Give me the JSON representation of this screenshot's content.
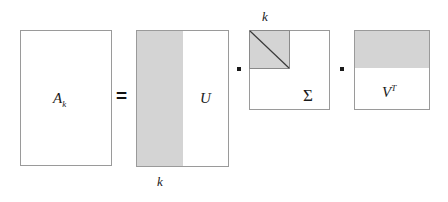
{
  "figure": {
    "equals_symbol": "=",
    "multiply_symbol": "·",
    "shade_color": "#d4d4d4",
    "border_color": "#9a9a9a",
    "text_color": "#1a1a1a",
    "background_color": "#ffffff"
  },
  "terms": {
    "a_k": {
      "label_base": "A",
      "label_sub": "k",
      "shaded": false
    },
    "u": {
      "label": "U",
      "rank_label": "k",
      "rank_label_position": "below-left",
      "shaded_region": "left-columns"
    },
    "sigma": {
      "label": "Σ",
      "rank_label": "k",
      "rank_label_position": "above-left",
      "shaded_region": "upper-left-triangle",
      "has_diagonal_line": true
    },
    "v_t": {
      "label_base": "V",
      "label_sup": "T",
      "shaded_region": "top-rows"
    }
  },
  "operators": {
    "equals": "=",
    "dot_1": "·",
    "dot_2": "·"
  }
}
